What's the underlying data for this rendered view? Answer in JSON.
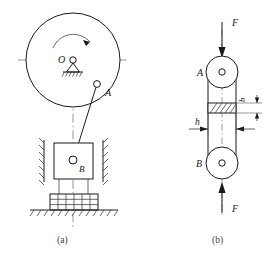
{
  "figure": {
    "captions": {
      "a": "(a)",
      "b": "(b)"
    },
    "colors": {
      "line": "#1a1a1a",
      "center_line": "#8c8c8c",
      "hatch": "#3a3a3a",
      "background": "#ffffff"
    },
    "panel_a": {
      "name": "slider-crank-mechanism",
      "labels": {
        "pivot": "O",
        "crank_pin": "A",
        "slider": "B"
      },
      "elements": [
        "rotating-disc",
        "fixed-pivot-support",
        "rotation-arrow",
        "crank-pin-joint",
        "connecting-rod",
        "slider-block",
        "guide-rails",
        "spring-base",
        "ground-hatching",
        "vertical-center-line",
        "horizontal-center-line"
      ],
      "disc": {
        "cx": 73,
        "cy": 60,
        "r": 47
      },
      "pivot_point": {
        "x": 73,
        "y": 60
      },
      "crank_pin_point": {
        "x": 97,
        "y": 85
      },
      "slider_joint": {
        "x": 73,
        "y": 160
      }
    },
    "panel_b": {
      "name": "two-force-member-free-body",
      "labels": {
        "top_joint": "A",
        "bottom_joint": "B",
        "force_top": "F",
        "force_bottom": "F",
        "dim_h": "h",
        "dim_b": "b"
      },
      "elements": [
        "upper-eye-joint",
        "lower-eye-joint",
        "link-body",
        "hatched-section",
        "downward-force-arrow",
        "upward-force-arrow",
        "width-dimension",
        "thickness-dimension",
        "vertical-center-line"
      ],
      "top_circle": {
        "cx": 222,
        "cy": 72,
        "r": 16
      },
      "bottom_circle": {
        "cx": 222,
        "cy": 163,
        "r": 16
      }
    }
  }
}
